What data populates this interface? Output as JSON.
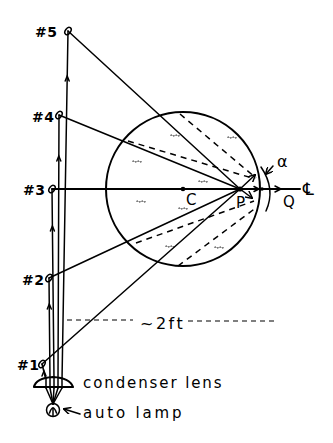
{
  "diagram": {
    "colors": {
      "line": "#000000",
      "background": "#ffffff"
    },
    "sources": [
      {
        "label": "#5"
      },
      {
        "label": "#4"
      },
      {
        "label": "#3"
      },
      {
        "label": "#2"
      },
      {
        "label": "#1"
      }
    ],
    "points": {
      "center": "C",
      "focus": "P",
      "vertex": "Q"
    },
    "angle_label": "α",
    "axis_symbol": "℄",
    "distance_label": "~2ft",
    "components": {
      "lens": "condenser lens",
      "lamp": "auto lamp"
    },
    "rays": [
      {
        "from": "#5",
        "to": "P",
        "style": "solid"
      },
      {
        "from": "#4",
        "to": "P",
        "style": "solid"
      },
      {
        "from": "#3",
        "to": "℄",
        "style": "solid (axis)"
      },
      {
        "from": "#2",
        "to": "P",
        "style": "solid"
      },
      {
        "from": "#1",
        "to": "P",
        "style": "solid"
      }
    ]
  }
}
